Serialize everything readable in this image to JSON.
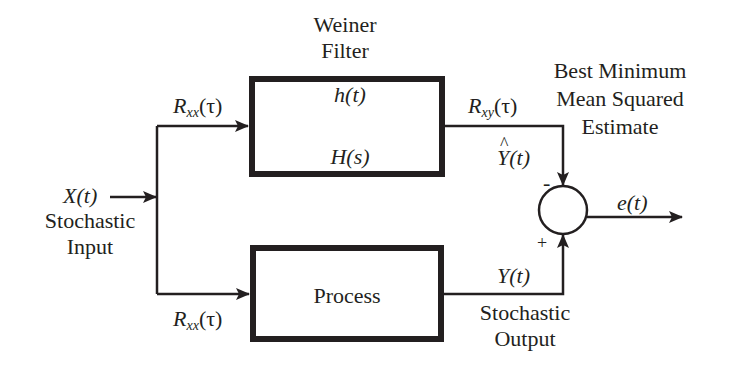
{
  "diagram": {
    "colors": {
      "stroke": "#231f20",
      "background": "#ffffff"
    },
    "filter_block": {
      "title_line1": "Weiner",
      "title_line2": "Filter",
      "impulse_response": "h(t)",
      "transfer_function": "H(s)"
    },
    "process_block": {
      "label": "Process"
    },
    "input": {
      "signal": "X(t)",
      "desc_line1": "Stochastic",
      "desc_line2": "Input"
    },
    "branches": {
      "top_autocorr": {
        "R": "R",
        "sub": "xx",
        "arg": "(τ)"
      },
      "bottom_autocorr": {
        "R": "R",
        "sub": "xx",
        "arg": "(τ)"
      }
    },
    "filter_output": {
      "crosscorr": {
        "R": "R",
        "sub": "xy",
        "arg": "(τ)"
      },
      "estimate": {
        "sym": "Y",
        "arg": "(t)"
      }
    },
    "process_output": {
      "signal": "Y(t)",
      "desc_line1": "Stochastic",
      "desc_line2": "Output"
    },
    "summing_junction": {
      "minus_sign": "-",
      "plus_sign": "+"
    },
    "error_output": {
      "signal": "e(t)"
    },
    "estimate_caption": {
      "line1": "Best Minimum",
      "line2": "Mean Squared",
      "line3": "Estimate"
    }
  }
}
